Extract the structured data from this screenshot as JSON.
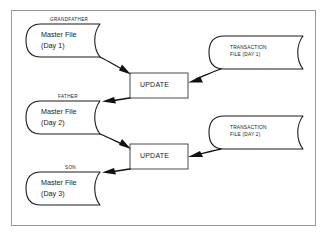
{
  "diagram": {
    "frame_border_color": "#9a9a9a",
    "background_color": "#ffffff",
    "line_color": "#111111",
    "master_files": [
      {
        "generation": "GRANDFATHER",
        "line1": "Master File",
        "line2": "(Day 1)"
      },
      {
        "generation": "FATHER",
        "line1": "Master File",
        "line2": "(Day 2)"
      },
      {
        "generation": "SON",
        "line1": "Master File",
        "line2": "(Day 3)"
      }
    ],
    "transaction_files": [
      {
        "line1": "TRANSACTION",
        "line2": "FILE (DAY 1)"
      },
      {
        "line1": "TRANSACTION",
        "line2": "FILE (DAY 2)"
      }
    ],
    "processes": [
      {
        "label": "UPDATE"
      },
      {
        "label": "UPDATE"
      }
    ]
  }
}
